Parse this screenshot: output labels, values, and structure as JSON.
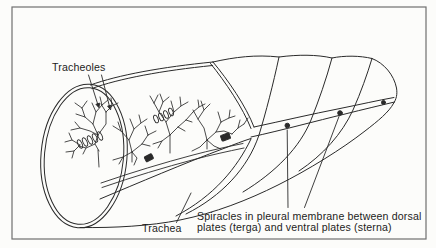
{
  "figure": {
    "type": "labeled-line-diagram",
    "labels": {
      "tracheoles": "Tracheoles",
      "trachea": "Trachea",
      "spiracles_line1": "Spiracles in pleural membrane between dorsal",
      "spiracles_line2": "plates (terga) and ventral plates (sterna)"
    },
    "spiracle_dot_count": 3,
    "colors": {
      "background": "#fcfcfa",
      "line": "#2a2a2a",
      "border": "#6f6f6f",
      "text": "#1c1c1c"
    }
  }
}
